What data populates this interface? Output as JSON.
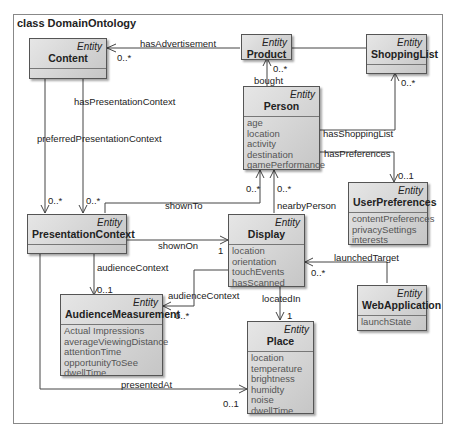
{
  "diagram": {
    "title": "class DomainOntology",
    "stereotype": "Entity"
  },
  "classes": {
    "content": {
      "stereotype": "Entity",
      "name": "Content",
      "attributes": []
    },
    "product": {
      "stereotype": "Entity",
      "name": "Product",
      "attributes": []
    },
    "shopping_list": {
      "stereotype": "Entity",
      "name": "ShoppingList",
      "attributes": []
    },
    "person": {
      "stereotype": "Entity",
      "name": "Person",
      "attributes": [
        "age",
        "location",
        "activity",
        "destination",
        "gamePerformance"
      ]
    },
    "user_preferences": {
      "stereotype": "Entity",
      "name": "UserPreferences",
      "attributes": [
        "contentPreferences",
        "privacySettings",
        "interests"
      ]
    },
    "presentation_context": {
      "stereotype": "Entity",
      "name": "PresentationContext",
      "attributes": []
    },
    "display": {
      "stereotype": "Entity",
      "name": "Display",
      "attributes": [
        "location",
        "orientation",
        "touchEvents",
        "hasScanned"
      ]
    },
    "web_application": {
      "stereotype": "Entity",
      "name": "WebApplication",
      "attributes": [
        "launchState"
      ]
    },
    "audience_measurement": {
      "stereotype": "Entity",
      "name": "AudienceMeasurement",
      "attributes": [
        "Actual Impressions",
        "averageViewingDistance",
        "attentionTime",
        "opportunityToSee",
        "dwellTime"
      ]
    },
    "place": {
      "stereotype": "Entity",
      "name": "Place",
      "attributes": [
        "location",
        "temperature",
        "brightness",
        "humidty",
        "noise",
        "dwellTime"
      ]
    }
  },
  "associations": {
    "has_advertisement": {
      "label": "hasAdvertisement",
      "multiplicity": "0..*"
    },
    "bought": {
      "label": "bought",
      "multiplicity": "0..*"
    },
    "has_shopping_list": {
      "label": "hasShoppingList",
      "multiplicity": "0..*"
    },
    "has_preferences": {
      "label": "hasPreferences",
      "multiplicity": "0..1"
    },
    "has_presentation_context": {
      "label": "hasPresentationContext",
      "multiplicity": "0..*"
    },
    "preferred_presentation_context": {
      "label": "preferredPresentationContext",
      "multiplicity": "0..*"
    },
    "shown_to": {
      "label": "shownTo",
      "multiplicity": "0..*"
    },
    "nearby_person": {
      "label": "nearbyPerson",
      "multiplicity": "0..*"
    },
    "shown_on": {
      "label": "shownOn",
      "multiplicity": "1"
    },
    "audience_context_pc": {
      "label": "audienceContext",
      "multiplicity": "0..1"
    },
    "audience_context_display": {
      "label": "audienceContext",
      "multiplicity": "0..*"
    },
    "launched_target": {
      "label": "launchedTarget",
      "multiplicity": "0..*"
    },
    "located_in": {
      "label": "locatedIn",
      "multiplicity": "1"
    },
    "presented_at": {
      "label": "presentedAt",
      "multiplicity": "0..1"
    }
  }
}
